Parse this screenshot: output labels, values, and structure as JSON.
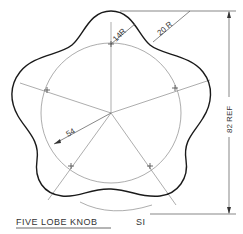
{
  "drawing": {
    "title": "FIVE LOBE KNOB",
    "scale_label": "SI",
    "dimensions": {
      "lobe_radius": "14R",
      "fillet_radius": "20 R",
      "pitch_radius": "54",
      "overall_height": "82 REF"
    }
  }
}
